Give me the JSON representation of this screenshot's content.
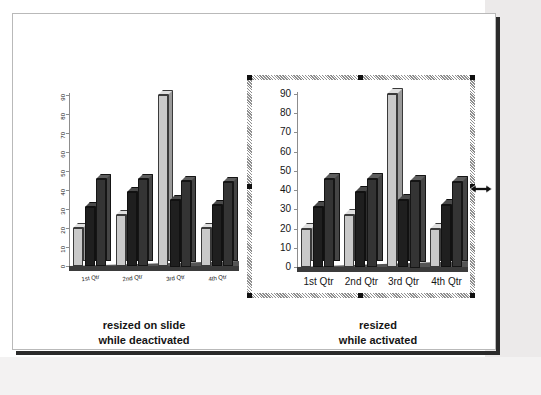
{
  "slide": {
    "captions": {
      "left": {
        "line1": "resized on slide",
        "line2": "while deactivated"
      },
      "right": {
        "line1": "resized",
        "line2": "while activated"
      }
    }
  },
  "colors": {
    "series_1": "#c9c9c9",
    "series_2": "#1f1f1f",
    "series_3": "#343434",
    "axis": "#8d8d8d",
    "floor": "#3b3b3b",
    "slide_border": "#b9b9b9",
    "slide_shadow": "#2b2b2b",
    "selection_handle": "#101010",
    "backdrop_grey": "#eceaea"
  },
  "selection": {
    "state": "activated",
    "handle_count": 8,
    "cursor": "horizontal-resize"
  },
  "chart_data": [
    {
      "id": "left-chart",
      "type": "bar",
      "title": "",
      "xlabel": "",
      "ylabel": "",
      "ylim": [
        0,
        90
      ],
      "yticks": [
        0,
        10,
        20,
        30,
        40,
        50,
        60,
        70,
        80,
        90
      ],
      "ytick_labels": [
        "0",
        "10",
        "20",
        "30",
        "40",
        "50",
        "60",
        "70",
        "80",
        "90"
      ],
      "tick_label_orientation": "vertical",
      "category_label_orientation": "rotated",
      "grid": false,
      "legend": "none",
      "three_d": true,
      "categories": [
        "1st Qtr",
        "2nd Qtr",
        "3rd Qtr",
        "4th Qtr"
      ],
      "series": [
        {
          "name": "Series 1",
          "color": "#c9c9c9",
          "values": [
            20,
            27,
            90,
            20
          ]
        },
        {
          "name": "Series 2",
          "color": "#1f1f1f",
          "values": [
            31,
            39,
            35,
            32
          ]
        },
        {
          "name": "Series 3",
          "color": "#343434",
          "values": [
            46,
            46,
            45,
            44
          ]
        }
      ]
    },
    {
      "id": "right-chart",
      "type": "bar",
      "title": "",
      "xlabel": "",
      "ylabel": "",
      "ylim": [
        0,
        90
      ],
      "yticks": [
        0,
        10,
        20,
        30,
        40,
        50,
        60,
        70,
        80,
        90
      ],
      "ytick_labels": [
        "0",
        "10",
        "20",
        "30",
        "40",
        "50",
        "60",
        "70",
        "80",
        "90"
      ],
      "tick_label_orientation": "horizontal",
      "category_label_orientation": "horizontal",
      "grid": false,
      "legend": "none",
      "three_d": true,
      "categories": [
        "1st Qtr",
        "2nd Qtr",
        "3rd Qtr",
        "4th Qtr"
      ],
      "series": [
        {
          "name": "Series 1",
          "color": "#c9c9c9",
          "values": [
            20,
            27,
            90,
            20
          ]
        },
        {
          "name": "Series 2",
          "color": "#1f1f1f",
          "values": [
            31,
            39,
            35,
            32
          ]
        },
        {
          "name": "Series 3",
          "color": "#343434",
          "values": [
            46,
            46,
            45,
            44
          ]
        }
      ]
    }
  ]
}
